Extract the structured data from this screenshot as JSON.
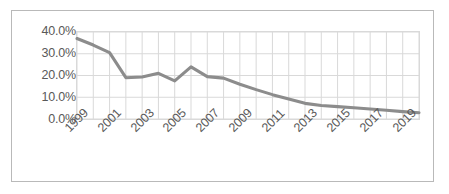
{
  "chart_data": {
    "type": "line",
    "title": "",
    "subtitle": "",
    "xlabel": "",
    "ylabel": "",
    "x": [
      1999,
      2000,
      2001,
      2002,
      2003,
      2004,
      2005,
      2006,
      2007,
      2008,
      2009,
      2010,
      2011,
      2012,
      2013,
      2014,
      2015,
      2016,
      2017,
      2018,
      2019,
      2020
    ],
    "values": [
      37.0,
      34.0,
      30.5,
      19.0,
      19.3,
      21.0,
      17.5,
      24.0,
      19.5,
      18.8,
      16.0,
      13.5,
      11.2,
      9.2,
      7.2,
      6.2,
      5.7,
      5.2,
      4.6,
      4.0,
      3.4,
      2.9
    ],
    "series": [
      {
        "name": "",
        "values": [
          37.0,
          34.0,
          30.5,
          19.0,
          19.3,
          21.0,
          17.5,
          24.0,
          19.5,
          18.8,
          16.0,
          13.5,
          11.2,
          9.2,
          7.2,
          6.2,
          5.7,
          5.2,
          4.6,
          4.0,
          3.4,
          2.9
        ],
        "color": "#8c8c8c"
      }
    ],
    "ylim": [
      0,
      40
    ],
    "ytick_labels": [
      "40.0%",
      "30.0%",
      "20.0%",
      "10.0%",
      "0.0%"
    ],
    "ytick_values": [
      40,
      30,
      20,
      10,
      0
    ],
    "xtick_labels": [
      "1999",
      "2001",
      "2003",
      "2005",
      "2007",
      "2009",
      "2011",
      "2013",
      "2015",
      "2017",
      "2019"
    ],
    "xtick_values": [
      1999,
      2001,
      2003,
      2005,
      2007,
      2009,
      2011,
      2013,
      2015,
      2017,
      2019
    ],
    "xtick_rotation": -45,
    "grid": true,
    "grid_color": "#d9d9d9",
    "legend": false,
    "legend_position": "none",
    "plot_background": "#ffffff",
    "border_color": "#b9b9b9",
    "text_color": "#595959",
    "annotations": []
  }
}
